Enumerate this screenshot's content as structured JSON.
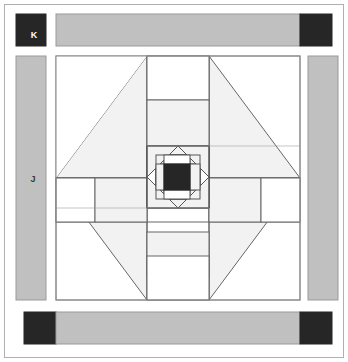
{
  "document": {
    "kind": "quilt-block-piecing-diagram",
    "title": "Quilt Block Assembly Diagram",
    "width": 348,
    "height": 362
  },
  "labels": [
    {
      "id": "K",
      "text": "K",
      "element": "corner-square",
      "color": "#ffffff"
    },
    {
      "id": "J",
      "text": "J",
      "element": "sashing-strip",
      "color": "#3a3a3a"
    }
  ],
  "colors": {
    "background": "#ffffff",
    "dark": "#262626",
    "sashing_gray": "#c0c0c0",
    "light_fill": "#f2f2f2",
    "white_fill": "#ffffff",
    "outline": "#555555",
    "thin_outline": "#777777",
    "frame": "#aaaaaa"
  },
  "geometry": {
    "outer_frame": {
      "x": 4,
      "y": 4,
      "width": 340,
      "height": 354
    },
    "block": {
      "x": 56,
      "y": 56,
      "width": 244,
      "height": 244
    },
    "center_square": {
      "x": 164,
      "y": 164,
      "width": 26,
      "height": 26
    },
    "top_sashing": {
      "x": 56,
      "y": 14,
      "width": 244,
      "height": 32
    },
    "bottom_sashing": {
      "x": 56,
      "y": 312,
      "width": 244,
      "height": 32
    },
    "left_sashing": {
      "x": 16,
      "y": 56,
      "width": 30,
      "height": 244
    },
    "right_sashing": {
      "x": 308,
      "y": 56,
      "width": 30,
      "height": 244
    },
    "corner_squares": [
      {
        "x": 16,
        "y": 14,
        "width": 30,
        "height": 32,
        "label": "K"
      },
      {
        "x": 300,
        "y": 14,
        "width": 32,
        "height": 32,
        "label": ""
      },
      {
        "x": 22,
        "y": 312,
        "width": 34,
        "height": 32,
        "label": ""
      },
      {
        "x": 300,
        "y": 312,
        "width": 32,
        "height": 32,
        "label": ""
      }
    ]
  },
  "structure": {
    "name": "medallion-block",
    "rounds": [
      {
        "round": 1,
        "name": "center-square",
        "piece": "dark-square"
      },
      {
        "round": 2,
        "name": "inner-flying-geese-ring",
        "piece": "light-triangles"
      },
      {
        "round": 3,
        "name": "inner-square-in-square",
        "piece": "light-triangles"
      },
      {
        "round": 4,
        "name": "middle-rails",
        "piece": "white-rectangles"
      },
      {
        "round": 5,
        "name": "outer-hourglass-corners",
        "piece": "light-triangles"
      }
    ],
    "sashing": {
      "strip_label": "J",
      "corner_label": "K"
    }
  }
}
